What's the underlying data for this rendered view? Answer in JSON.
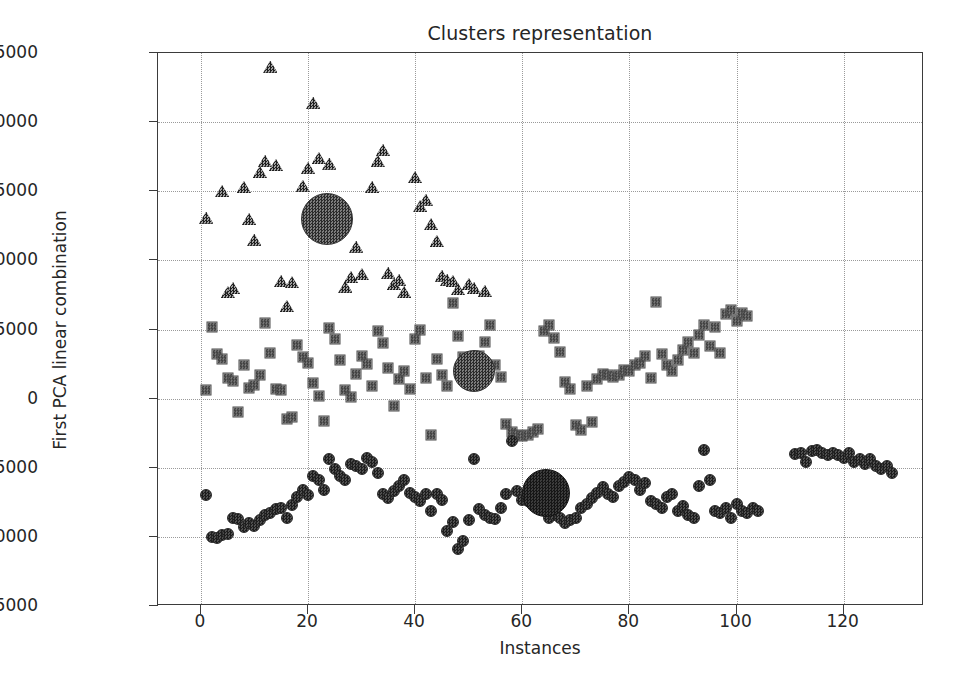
{
  "chart_data": {
    "type": "scatter",
    "title": "Clusters representation",
    "xlabel": "Instances",
    "ylabel": "First PCA linear combination",
    "xlim": [
      -8,
      135
    ],
    "ylim": [
      -15000,
      25000
    ],
    "xticks": [
      0,
      20,
      40,
      60,
      80,
      100,
      120
    ],
    "xticklabels": [
      "0",
      "20",
      "40",
      "60",
      "80",
      "100",
      "120"
    ],
    "yticks": [
      -15000,
      -10000,
      -5000,
      0,
      5000,
      10000,
      15000,
      20000,
      25000
    ],
    "yticklabels": [
      "−15000",
      "−10000",
      "−5000",
      "0",
      "5000",
      "10000",
      "15000",
      "20000",
      "25000"
    ],
    "grid": true,
    "grid_style": "dotted",
    "legend": null,
    "series": [
      {
        "name": "Cluster 1",
        "marker": "triangle",
        "color": "#5d5d5d",
        "points": [
          [
            1,
            13100
          ],
          [
            4,
            15000
          ],
          [
            5,
            7700
          ],
          [
            6,
            8000
          ],
          [
            8,
            15300
          ],
          [
            9,
            13000
          ],
          [
            10,
            11500
          ],
          [
            11,
            16400
          ],
          [
            12,
            17200
          ],
          [
            13,
            24000
          ],
          [
            14,
            16900
          ],
          [
            15,
            8500
          ],
          [
            16,
            6700
          ],
          [
            17,
            8400
          ],
          [
            19,
            15400
          ],
          [
            20,
            16700
          ],
          [
            21,
            21400
          ],
          [
            22,
            17400
          ],
          [
            24,
            17000
          ],
          [
            25,
            12200
          ],
          [
            26,
            12300
          ],
          [
            27,
            8100
          ],
          [
            28,
            8800
          ],
          [
            29,
            11000
          ],
          [
            30,
            9000
          ],
          [
            32,
            15300
          ],
          [
            33,
            17200
          ],
          [
            34,
            18000
          ],
          [
            35,
            9100
          ],
          [
            36,
            8300
          ],
          [
            37,
            8600
          ],
          [
            38,
            7700
          ],
          [
            40,
            16000
          ],
          [
            41,
            13900
          ],
          [
            42,
            14400
          ],
          [
            43,
            12600
          ],
          [
            44,
            11400
          ],
          [
            45,
            8900
          ],
          [
            46,
            8600
          ],
          [
            47,
            8500
          ],
          [
            48,
            7900
          ],
          [
            50,
            8300
          ],
          [
            51,
            8000
          ],
          [
            53,
            7800
          ]
        ]
      },
      {
        "name": "Cluster 2",
        "marker": "square",
        "color": "#4a4a4a",
        "points": [
          [
            1,
            600
          ],
          [
            2,
            5200
          ],
          [
            3,
            3200
          ],
          [
            4,
            2900
          ],
          [
            5,
            1500
          ],
          [
            6,
            1300
          ],
          [
            7,
            -1000
          ],
          [
            8,
            2400
          ],
          [
            9,
            800
          ],
          [
            10,
            1000
          ],
          [
            11,
            1700
          ],
          [
            12,
            5500
          ],
          [
            13,
            3300
          ],
          [
            14,
            700
          ],
          [
            15,
            600
          ],
          [
            16,
            -1500
          ],
          [
            17,
            -1300
          ],
          [
            18,
            3900
          ],
          [
            19,
            3000
          ],
          [
            20,
            2600
          ],
          [
            21,
            1100
          ],
          [
            22,
            200
          ],
          [
            23,
            -1600
          ],
          [
            24,
            5100
          ],
          [
            25,
            4300
          ],
          [
            26,
            2800
          ],
          [
            27,
            600
          ],
          [
            28,
            100
          ],
          [
            29,
            1800
          ],
          [
            30,
            3100
          ],
          [
            31,
            2500
          ],
          [
            32,
            900
          ],
          [
            33,
            4900
          ],
          [
            34,
            4000
          ],
          [
            35,
            2200
          ],
          [
            36,
            -500
          ],
          [
            37,
            1400
          ],
          [
            38,
            2000
          ],
          [
            39,
            700
          ],
          [
            40,
            4300
          ],
          [
            41,
            5000
          ],
          [
            42,
            1500
          ],
          [
            43,
            -2600
          ],
          [
            44,
            2900
          ],
          [
            45,
            1700
          ],
          [
            46,
            900
          ],
          [
            47,
            6900
          ],
          [
            48,
            4500
          ],
          [
            49,
            3000
          ],
          [
            50,
            2500
          ],
          [
            51,
            1000
          ],
          [
            52,
            3100
          ],
          [
            53,
            4100
          ],
          [
            54,
            5300
          ],
          [
            55,
            2400
          ],
          [
            56,
            1600
          ],
          [
            57,
            -1800
          ],
          [
            58,
            -2400
          ],
          [
            59,
            -2600
          ],
          [
            60,
            -2700
          ],
          [
            61,
            -2600
          ],
          [
            62,
            -2400
          ],
          [
            63,
            -2200
          ],
          [
            64,
            4900
          ],
          [
            65,
            5300
          ],
          [
            66,
            4400
          ],
          [
            67,
            3400
          ],
          [
            68,
            1200
          ],
          [
            69,
            700
          ],
          [
            70,
            -1900
          ],
          [
            71,
            -2300
          ],
          [
            72,
            900
          ],
          [
            73,
            -1700
          ],
          [
            74,
            1400
          ],
          [
            75,
            1800
          ],
          [
            76,
            1700
          ],
          [
            77,
            1600
          ],
          [
            78,
            1700
          ],
          [
            79,
            2100
          ],
          [
            80,
            2000
          ],
          [
            81,
            2400
          ],
          [
            82,
            2600
          ],
          [
            83,
            3100
          ],
          [
            84,
            1500
          ],
          [
            85,
            7000
          ],
          [
            86,
            3200
          ],
          [
            87,
            2400
          ],
          [
            88,
            2000
          ],
          [
            89,
            2800
          ],
          [
            90,
            3500
          ],
          [
            91,
            4100
          ],
          [
            92,
            3300
          ],
          [
            93,
            4600
          ],
          [
            94,
            5300
          ],
          [
            95,
            3800
          ],
          [
            96,
            5200
          ],
          [
            97,
            3300
          ],
          [
            98,
            6100
          ],
          [
            99,
            6400
          ],
          [
            100,
            5600
          ],
          [
            101,
            6200
          ],
          [
            102,
            6000
          ]
        ]
      },
      {
        "name": "Cluster 3",
        "marker": "circle",
        "color": "#1d1d1d",
        "points": [
          [
            1,
            -7000
          ],
          [
            2,
            -10000
          ],
          [
            3,
            -10100
          ],
          [
            4,
            -9900
          ],
          [
            5,
            -9800
          ],
          [
            6,
            -8600
          ],
          [
            7,
            -8700
          ],
          [
            8,
            -9300
          ],
          [
            9,
            -9000
          ],
          [
            10,
            -9200
          ],
          [
            11,
            -8800
          ],
          [
            12,
            -8400
          ],
          [
            13,
            -8300
          ],
          [
            14,
            -8000
          ],
          [
            15,
            -7900
          ],
          [
            16,
            -8600
          ],
          [
            17,
            -7700
          ],
          [
            18,
            -7100
          ],
          [
            19,
            -6600
          ],
          [
            20,
            -7000
          ],
          [
            21,
            -5600
          ],
          [
            22,
            -5900
          ],
          [
            23,
            -6600
          ],
          [
            24,
            -4400
          ],
          [
            25,
            -5100
          ],
          [
            26,
            -5600
          ],
          [
            27,
            -5900
          ],
          [
            28,
            -4700
          ],
          [
            29,
            -4900
          ],
          [
            30,
            -5100
          ],
          [
            31,
            -4300
          ],
          [
            32,
            -4600
          ],
          [
            33,
            -5400
          ],
          [
            34,
            -6900
          ],
          [
            35,
            -7200
          ],
          [
            36,
            -6700
          ],
          [
            37,
            -6300
          ],
          [
            38,
            -5900
          ],
          [
            39,
            -6800
          ],
          [
            40,
            -7100
          ],
          [
            41,
            -7400
          ],
          [
            42,
            -6900
          ],
          [
            43,
            -8100
          ],
          [
            44,
            -6900
          ],
          [
            45,
            -7300
          ],
          [
            46,
            -9600
          ],
          [
            47,
            -8900
          ],
          [
            48,
            -10900
          ],
          [
            49,
            -10300
          ],
          [
            50,
            -8800
          ],
          [
            51,
            -4400
          ],
          [
            52,
            -8000
          ],
          [
            53,
            -8400
          ],
          [
            54,
            -8600
          ],
          [
            55,
            -8700
          ],
          [
            56,
            -7900
          ],
          [
            57,
            -6900
          ],
          [
            58,
            -3100
          ],
          [
            59,
            -6700
          ],
          [
            60,
            -7300
          ],
          [
            61,
            -7400
          ],
          [
            62,
            -6900
          ],
          [
            63,
            -7100
          ],
          [
            64,
            -6800
          ],
          [
            65,
            -8600
          ],
          [
            66,
            -8400
          ],
          [
            67,
            -8600
          ],
          [
            68,
            -9000
          ],
          [
            69,
            -8800
          ],
          [
            70,
            -8600
          ],
          [
            71,
            -7900
          ],
          [
            72,
            -7600
          ],
          [
            73,
            -7200
          ],
          [
            74,
            -6800
          ],
          [
            75,
            -6400
          ],
          [
            76,
            -6900
          ],
          [
            77,
            -7100
          ],
          [
            78,
            -6300
          ],
          [
            79,
            -6000
          ],
          [
            80,
            -5700
          ],
          [
            81,
            -5900
          ],
          [
            82,
            -6600
          ],
          [
            83,
            -6100
          ],
          [
            84,
            -7400
          ],
          [
            85,
            -7600
          ],
          [
            86,
            -7900
          ],
          [
            87,
            -7100
          ],
          [
            88,
            -6900
          ],
          [
            89,
            -8100
          ],
          [
            90,
            -7800
          ],
          [
            91,
            -8400
          ],
          [
            92,
            -8600
          ],
          [
            93,
            -6300
          ],
          [
            94,
            -3700
          ],
          [
            95,
            -5900
          ],
          [
            96,
            -8100
          ],
          [
            97,
            -8300
          ],
          [
            98,
            -7900
          ],
          [
            99,
            -8600
          ],
          [
            100,
            -7600
          ],
          [
            101,
            -8100
          ],
          [
            102,
            -8300
          ],
          [
            103,
            -7900
          ],
          [
            104,
            -8100
          ],
          [
            111,
            -4000
          ],
          [
            112,
            -3900
          ],
          [
            113,
            -4600
          ],
          [
            114,
            -3800
          ],
          [
            115,
            -3700
          ],
          [
            116,
            -3900
          ],
          [
            117,
            -4100
          ],
          [
            118,
            -3900
          ],
          [
            119,
            -4100
          ],
          [
            120,
            -4300
          ],
          [
            121,
            -3900
          ],
          [
            122,
            -4600
          ],
          [
            123,
            -4400
          ],
          [
            124,
            -4700
          ],
          [
            125,
            -4400
          ],
          [
            126,
            -4900
          ],
          [
            127,
            -5100
          ],
          [
            128,
            -4900
          ],
          [
            129,
            -5400
          ]
        ]
      }
    ],
    "centroids": [
      {
        "name": "Cluster 1 centroid",
        "x": 23.5,
        "y": 13000,
        "size": 52,
        "style": "light"
      },
      {
        "name": "Cluster 2 centroid",
        "x": 51.0,
        "y": 2000,
        "size": 42,
        "style": "light"
      },
      {
        "name": "Cluster 3 centroid",
        "x": 64.5,
        "y": -6800,
        "size": 48,
        "style": "dark"
      }
    ]
  }
}
